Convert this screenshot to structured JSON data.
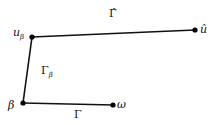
{
  "diagram": {
    "nodes": [
      {
        "id": "u_beta",
        "label": "u",
        "sub": "β",
        "x": 32,
        "y": 37
      },
      {
        "id": "u_hat",
        "label": "û",
        "x": 195,
        "y": 30
      },
      {
        "id": "beta",
        "label": "β",
        "x": 23,
        "y": 103
      },
      {
        "id": "omega",
        "label": "ω",
        "x": 113,
        "y": 105
      }
    ],
    "edges": [
      {
        "from": "u_beta",
        "to": "u_hat",
        "label": "Γ̂"
      },
      {
        "from": "beta",
        "to": "u_beta",
        "label": "Γ",
        "sub": "β"
      },
      {
        "from": "beta",
        "to": "omega",
        "label": "Γ"
      }
    ],
    "labels": {
      "u_beta": "u",
      "u_beta_sub": "β",
      "u_hat": "û",
      "beta": "β",
      "omega": "ω",
      "gamma_hat": "Γ̂",
      "gamma_beta": "Γ",
      "gamma_beta_sub": "β",
      "gamma": "Γ"
    },
    "colors": {
      "line": "#111111",
      "node": "#000000"
    }
  }
}
